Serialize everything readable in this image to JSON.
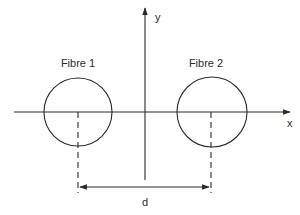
{
  "diagram": {
    "fibres": [
      {
        "label": "Fibre 1",
        "cx": 78,
        "cy": 112,
        "r": 34
      },
      {
        "label": "Fibre 2",
        "cx": 212,
        "cy": 112,
        "r": 35
      }
    ],
    "axes": {
      "x_label": "x",
      "y_label": "y"
    },
    "dimension": {
      "label": "d"
    },
    "colors": {
      "stroke": "#2a2a2a",
      "background": "#ffffff"
    }
  }
}
